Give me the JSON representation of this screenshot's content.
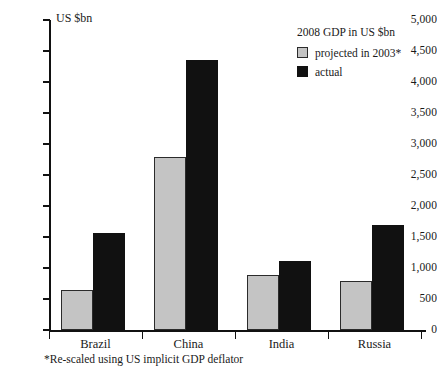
{
  "chart_data": {
    "type": "bar",
    "title": "",
    "subtitle": "",
    "xlabel": "",
    "ylabel": "US $bn",
    "ylim": [
      0,
      5000
    ],
    "grid": false,
    "legend_position": "top-right",
    "legend_title": "2008 GDP in US $bn",
    "categories": [
      "Brazil",
      "China",
      "India",
      "Russia"
    ],
    "series": [
      {
        "name": "projected in 2003*",
        "color": "#c4c4c4",
        "values": [
          650,
          2790,
          890,
          790
        ]
      },
      {
        "name": "actual",
        "color": "#111111",
        "values": [
          1570,
          4355,
          1110,
          1690
        ]
      }
    ],
    "ytick_labels": [
      "5,000",
      "4,500",
      "4,000",
      "3,500",
      "3,000",
      "2,500",
      "2,000",
      "1,500",
      "1,000",
      "500",
      "0"
    ],
    "ytick_values": [
      5000,
      4500,
      4000,
      3500,
      3000,
      2500,
      2000,
      1500,
      1000,
      500,
      0
    ],
    "annotations": [
      "*Re-scaled using US implicit GDP deflator"
    ]
  },
  "axis": {
    "unit_label": "US $bn"
  },
  "legend": {
    "title": "2008 GDP in US $bn",
    "items": [
      {
        "label": "projected in 2003*",
        "swatch": "projected"
      },
      {
        "label": "actual",
        "swatch": "actual"
      }
    ]
  },
  "footnote": {
    "text": "*Re-scaled using US implicit GDP deflator"
  },
  "colors": {
    "projected": "#c4c4c4",
    "actual": "#111111",
    "axis": "#111111",
    "background": "#ffffff"
  }
}
